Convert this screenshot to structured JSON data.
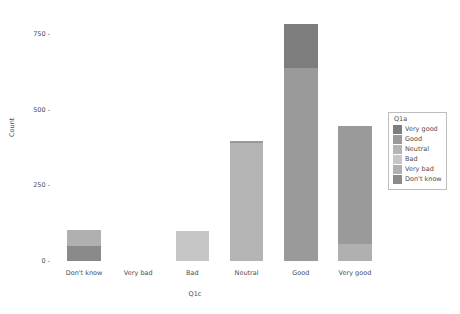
{
  "chart_data": {
    "type": "bar",
    "stacked": true,
    "title": "",
    "xlabel": "Q1c",
    "ylabel": "Count",
    "categories": [
      "Don't know",
      "Very bad",
      "Bad",
      "Neutral",
      "Good",
      "Very good"
    ],
    "yticks": [
      0,
      250,
      500,
      750
    ],
    "ytick_labels": [
      "0",
      "250",
      "500",
      "750"
    ],
    "ylim": [
      0,
      830
    ],
    "grid": false,
    "legend_title": "Q1a",
    "legend_position": "right",
    "series": [
      {
        "name": "Very good",
        "color": "#7d7d7d",
        "values": [
          0,
          0,
          0,
          0,
          145,
          0
        ]
      },
      {
        "name": "Good",
        "color": "#9a9a9a",
        "values": [
          0,
          0,
          0,
          9,
          639,
          390
        ]
      },
      {
        "name": "Neutral",
        "color": "#b4b4b4",
        "values": [
          0,
          0,
          0,
          389,
          0,
          0
        ]
      },
      {
        "name": "Bad",
        "color": "#c6c6c6",
        "values": [
          0,
          0,
          100,
          0,
          0,
          0
        ]
      },
      {
        "name": "Very bad",
        "color": "#b0b0b0",
        "values": [
          55,
          0,
          0,
          0,
          0,
          55
        ]
      },
      {
        "name": "Don't know",
        "color": "#8a8a8a",
        "values": [
          48,
          0,
          0,
          0,
          0,
          0
        ]
      }
    ],
    "bar_totals": [
      103,
      0,
      100,
      398,
      784,
      445
    ]
  },
  "legend": {
    "title": "Q1a",
    "items": [
      {
        "label": "Very good",
        "color": "#7d7d7d"
      },
      {
        "label": "Good",
        "color": "#9a9a9a"
      },
      {
        "label": "Neutral",
        "color": "#b4b4b4"
      },
      {
        "label": "Bad",
        "color": "#c6c6c6"
      },
      {
        "label": "Very bad",
        "color": "#b0b0b0"
      },
      {
        "label": "Don't know",
        "color": "#8a8a8a"
      }
    ]
  }
}
